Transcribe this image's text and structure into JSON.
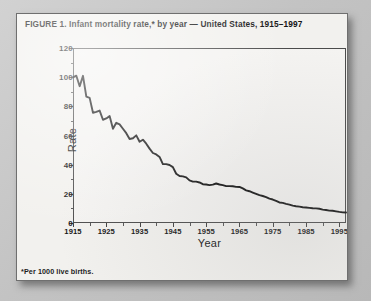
{
  "figure": {
    "title": "FIGURE 1. Infant mortality rate,* by year — United States, 1915–1997",
    "footnote": "*Per 1000 live births."
  },
  "chart_data": {
    "type": "line",
    "title": "FIGURE 1. Infant mortality rate,* by year — United States, 1915–1997",
    "xlabel": "Year",
    "ylabel": "Rate",
    "xlim": [
      1915,
      1997
    ],
    "ylim": [
      0,
      120
    ],
    "yticks": [
      0,
      20,
      40,
      60,
      80,
      100,
      120
    ],
    "xticks": [
      1915,
      1925,
      1935,
      1945,
      1955,
      1965,
      1975,
      1985,
      1995
    ],
    "grid": false,
    "legend": null,
    "series": [
      {
        "name": "Infant mortality rate per 1000 live births",
        "color": "#111111",
        "x": [
          1915,
          1916,
          1917,
          1918,
          1919,
          1920,
          1921,
          1922,
          1923,
          1924,
          1925,
          1926,
          1927,
          1928,
          1929,
          1930,
          1931,
          1932,
          1933,
          1934,
          1935,
          1936,
          1937,
          1938,
          1939,
          1940,
          1941,
          1942,
          1943,
          1944,
          1945,
          1946,
          1947,
          1948,
          1949,
          1950,
          1951,
          1952,
          1953,
          1954,
          1955,
          1956,
          1957,
          1958,
          1959,
          1960,
          1961,
          1962,
          1963,
          1964,
          1965,
          1966,
          1967,
          1968,
          1969,
          1970,
          1971,
          1972,
          1973,
          1974,
          1975,
          1976,
          1977,
          1978,
          1979,
          1980,
          1981,
          1982,
          1983,
          1984,
          1985,
          1986,
          1987,
          1988,
          1989,
          1990,
          1991,
          1992,
          1993,
          1994,
          1995,
          1996,
          1997
        ],
        "values": [
          99.9,
          101.0,
          93.8,
          100.9,
          86.6,
          85.8,
          75.6,
          76.2,
          77.1,
          70.8,
          71.7,
          73.3,
          64.6,
          68.7,
          67.6,
          64.6,
          61.6,
          57.6,
          58.1,
          60.1,
          55.7,
          57.1,
          54.4,
          51.0,
          48.0,
          47.0,
          45.3,
          40.4,
          40.4,
          39.8,
          38.3,
          33.8,
          32.2,
          32.0,
          31.3,
          29.2,
          28.4,
          28.4,
          27.8,
          26.6,
          26.4,
          26.0,
          26.3,
          27.1,
          26.4,
          26.0,
          25.3,
          25.3,
          25.2,
          24.8,
          24.7,
          23.7,
          22.4,
          21.8,
          20.9,
          20.0,
          19.1,
          18.5,
          17.7,
          16.7,
          16.1,
          15.2,
          14.1,
          13.8,
          13.1,
          12.6,
          11.9,
          11.5,
          11.2,
          10.8,
          10.6,
          10.4,
          10.1,
          10.0,
          9.8,
          9.2,
          8.9,
          8.5,
          8.4,
          8.0,
          7.6,
          7.3,
          7.2
        ]
      }
    ]
  },
  "axes": {
    "yticks": [
      "0",
      "20",
      "40",
      "60",
      "80",
      "100",
      "120"
    ],
    "xticks": [
      "1915",
      "1925",
      "1935",
      "1945",
      "1955",
      "1965",
      "1975",
      "1985",
      "1995"
    ],
    "ylabel": "Rate",
    "xlabel": "Year"
  }
}
